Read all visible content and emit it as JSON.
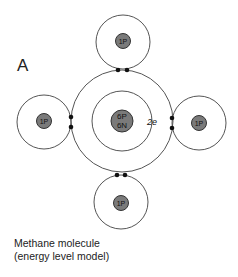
{
  "figure": {
    "label": "A",
    "caption_line1": "Methane molecule",
    "caption_line2": "(energy level model)"
  },
  "atoms": {
    "carbon": {
      "nucleus_line1": "6P",
      "nucleus_line2": "6N",
      "shell_label": "2e"
    },
    "hydrogen_top": {
      "nucleus": "1P"
    },
    "hydrogen_left": {
      "nucleus": "1P"
    },
    "hydrogen_right": {
      "nucleus": "1P"
    },
    "hydrogen_bottom": {
      "nucleus": "1P"
    }
  },
  "colors": {
    "line": "#555555",
    "nucleus_fill": "#7a7a7a",
    "electron": "#111111",
    "text": "#222222"
  }
}
